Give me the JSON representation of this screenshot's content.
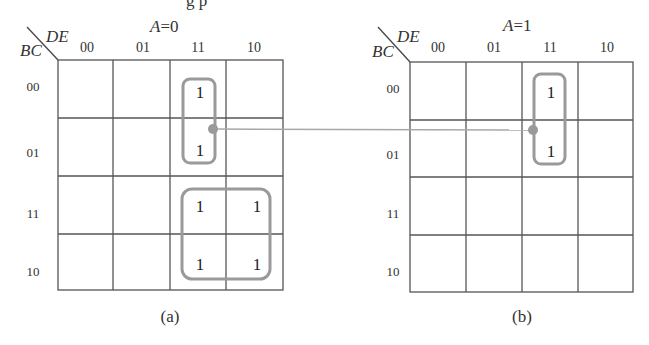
{
  "figure": {
    "cropped_top_text": "g  p",
    "maps": [
      {
        "id": "a",
        "title_var": "A",
        "title_eq": "=0",
        "row_var": "BC",
        "col_var": "DE",
        "col_labels": [
          "00",
          "01",
          "11",
          "10"
        ],
        "row_labels": [
          "00",
          "01",
          "11",
          "10"
        ],
        "cells": [
          [
            "",
            "",
            "1",
            ""
          ],
          [
            "",
            "",
            "1",
            ""
          ],
          [
            "",
            "",
            "1",
            "1"
          ],
          [
            "",
            "",
            "1",
            "1"
          ]
        ],
        "caption": "(a)"
      },
      {
        "id": "b",
        "title_var": "A",
        "title_eq": "=1",
        "row_var": "BC",
        "col_var": "DE",
        "col_labels": [
          "00",
          "01",
          "11",
          "10"
        ],
        "row_labels": [
          "00",
          "01",
          "11",
          "10"
        ],
        "cells": [
          [
            "",
            "",
            "1",
            ""
          ],
          [
            "",
            "",
            "1",
            ""
          ],
          [
            "",
            "",
            "",
            ""
          ],
          [
            "",
            "",
            "",
            ""
          ]
        ],
        "caption": "(b)"
      }
    ],
    "groups": [
      {
        "map": "a",
        "cells": "rows 00-01, col 11",
        "description": "vertical pair"
      },
      {
        "map": "a",
        "cells": "rows 11-10, cols 11-10",
        "description": "quad"
      },
      {
        "map": "b",
        "cells": "rows 00-01, col 11",
        "description": "vertical pair"
      }
    ],
    "connector": {
      "from": "map a group 1",
      "to": "map b group 1",
      "color": "#a8a8a8"
    },
    "colors": {
      "grid": "#555555",
      "loop": "#9a9a9a",
      "text": "#333333"
    }
  }
}
